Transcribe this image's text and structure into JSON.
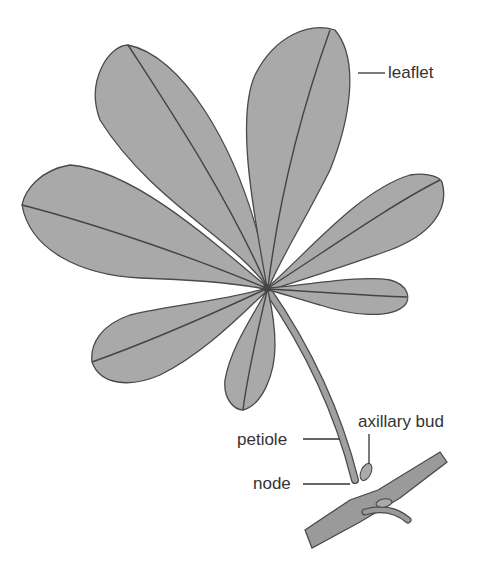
{
  "figure": {
    "labels": {
      "leaflet": "leaflet",
      "petiole": "petiole",
      "node": "node",
      "axillary_bud": "axillary bud"
    },
    "colors": {
      "leaf_fill": "#a9a9a9",
      "outline": "#4a4a4a",
      "background": "#ffffff",
      "text": "#333333"
    },
    "leaflet_count": 7
  }
}
